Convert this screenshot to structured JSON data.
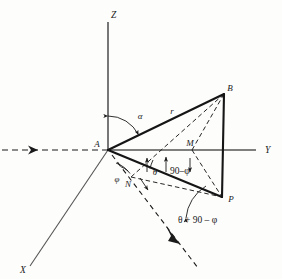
{
  "figure": {
    "background_color": "#fdfdfc",
    "ink_color": "#1a1a1a"
  },
  "axes": [
    {
      "name": "z-axis",
      "label": "Z",
      "kind": "solid",
      "from": [
        108,
        150
      ],
      "to": [
        108,
        22
      ],
      "label_pos": [
        111,
        14
      ]
    },
    {
      "name": "y-axis",
      "label": "Y",
      "kind": "solid",
      "from": [
        108,
        150
      ],
      "to": [
        262,
        150
      ],
      "label_pos": [
        266,
        153
      ]
    },
    {
      "name": "x-axis",
      "label": "X",
      "kind": "solid",
      "from": [
        108,
        150
      ],
      "to": [
        30,
        268
      ],
      "label_pos": [
        22,
        272
      ]
    }
  ],
  "reference_line": {
    "name": "incident-ray",
    "kind": "dashed",
    "from": [
      2,
      150
    ],
    "to": [
      108,
      150
    ],
    "arrow_at": [
      36,
      150
    ],
    "arrow_dir": "right"
  },
  "projected_ray": {
    "name": "projected-ray",
    "kind": "dashed",
    "from": [
      108,
      150
    ],
    "to": [
      196,
      265
    ],
    "arrow_at": [
      176,
      237
    ],
    "arrow_dir": "down-right"
  },
  "points": [
    {
      "name": "A",
      "label": "A",
      "pos": [
        108,
        150
      ],
      "label_pos": [
        99,
        146
      ],
      "role": "origin"
    },
    {
      "name": "B",
      "label": "B",
      "pos": [
        224,
        94
      ],
      "label_pos": [
        228,
        90
      ],
      "role": "apex"
    },
    {
      "name": "M",
      "label": "M",
      "pos": [
        191,
        150
      ],
      "label_pos": [
        188,
        146
      ],
      "role": "y-axis-foot"
    },
    {
      "name": "N",
      "label": "N",
      "pos": [
        131,
        177
      ],
      "label_pos": [
        127,
        184
      ],
      "role": "near-origin-foot"
    },
    {
      "name": "P",
      "label": "P",
      "pos": [
        222,
        198
      ],
      "label_pos": [
        228,
        199
      ],
      "role": "base"
    }
  ],
  "solid_edges": [
    {
      "name": "edge-A-B",
      "from": [
        108,
        150
      ],
      "to": [
        224,
        94
      ]
    },
    {
      "name": "edge-A-P",
      "from": [
        108,
        150
      ],
      "to": [
        222,
        198
      ]
    },
    {
      "name": "edge-B-P",
      "from": [
        224,
        94
      ],
      "to": [
        222,
        198
      ]
    }
  ],
  "dashed_edges": [
    {
      "name": "edge-B-M",
      "from": [
        224,
        94
      ],
      "to": [
        191,
        150
      ]
    },
    {
      "name": "edge-B-N",
      "from": [
        224,
        94
      ],
      "to": [
        131,
        177
      ]
    },
    {
      "name": "edge-M-P",
      "from": [
        191,
        150
      ],
      "to": [
        222,
        198
      ]
    },
    {
      "name": "edge-N-P",
      "from": [
        131,
        177
      ],
      "to": [
        222,
        198
      ]
    }
  ],
  "segment_labels": [
    {
      "name": "radius-r",
      "label": "r",
      "pos": [
        171,
        112
      ]
    }
  ],
  "angles": [
    {
      "name": "angle-alpha",
      "label": "α",
      "label_pos": [
        139,
        116
      ],
      "vertex": [
        108,
        150
      ],
      "arc": {
        "radius": 34,
        "start_deg": 90,
        "end_deg": 26
      },
      "tick_arrows": [
        "z-side",
        "ab-side"
      ]
    },
    {
      "name": "angle-theta",
      "label": "θ",
      "label_pos": [
        153,
        170
      ],
      "vertex": [
        108,
        150
      ],
      "arc": {
        "radius": 47,
        "start_deg": -8,
        "end_deg": -23
      }
    },
    {
      "name": "angle-90-minus-phi",
      "label": "90–φ",
      "label_pos": [
        168,
        170
      ],
      "vertex": [
        108,
        150
      ]
    },
    {
      "name": "angle-phi",
      "label": "φ",
      "label_pos": [
        117,
        177
      ],
      "vertex": [
        108,
        150
      ],
      "arc": {
        "radius": 22,
        "start_deg": -23,
        "end_deg": -56
      }
    },
    {
      "name": "angle-theta-plus-90-minus-phi",
      "label": "θ + 90 – φ",
      "label_pos": [
        178,
        220
      ],
      "vertex": [
        222,
        198
      ],
      "arc": {
        "radius": 40,
        "start_deg": 150,
        "end_deg": 200
      }
    }
  ],
  "expressions": {
    "alpha": "α",
    "theta": "θ",
    "phi": "φ",
    "ninety_minus_phi": "90–φ",
    "theta_plus_ninety_minus_phi": "θ + 90 – φ",
    "radius": "r"
  }
}
